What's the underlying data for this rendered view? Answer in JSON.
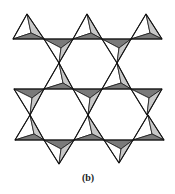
{
  "figure": {
    "caption": "(b)",
    "colors": {
      "background": "#ffffff",
      "face_light": "#ffffff",
      "face_mid": "#c8c8c8",
      "face_dark": "#7a7a7a",
      "stroke": "#111111"
    },
    "tetrahedra_up": [
      {
        "apex": [
          27,
          14
        ],
        "left": [
          13,
          39
        ],
        "right": [
          44,
          39
        ],
        "center": [
          31,
          33
        ]
      },
      {
        "apex": [
          87,
          14
        ],
        "left": [
          73,
          39
        ],
        "right": [
          102,
          39
        ],
        "center": [
          91,
          33
        ]
      },
      {
        "apex": [
          146,
          14
        ],
        "left": [
          131,
          39
        ],
        "right": [
          162,
          39
        ],
        "center": [
          150,
          33
        ]
      },
      {
        "apex": [
          59,
          63
        ],
        "left": [
          44,
          89
        ],
        "right": [
          73,
          89
        ],
        "center": [
          63,
          83
        ]
      },
      {
        "apex": [
          117,
          63
        ],
        "left": [
          102,
          89
        ],
        "right": [
          131,
          89
        ],
        "center": [
          121,
          83
        ]
      },
      {
        "apex": [
          30,
          115
        ],
        "left": [
          15,
          140
        ],
        "right": [
          44,
          140
        ],
        "center": [
          34,
          134
        ]
      },
      {
        "apex": [
          88,
          115
        ],
        "left": [
          74,
          140
        ],
        "right": [
          104,
          140
        ],
        "center": [
          92,
          134
        ]
      },
      {
        "apex": [
          148,
          115
        ],
        "left": [
          133,
          140
        ],
        "right": [
          164,
          140
        ],
        "center": [
          152,
          134
        ]
      }
    ],
    "tetrahedra_down": [
      {
        "left": [
          44,
          39
        ],
        "right": [
          73,
          39
        ],
        "bottom": [
          59,
          63
        ],
        "center": [
          61,
          48
        ]
      },
      {
        "left": [
          102,
          39
        ],
        "right": [
          131,
          39
        ],
        "bottom": [
          117,
          63
        ],
        "center": [
          119,
          48
        ]
      },
      {
        "left": [
          14,
          89
        ],
        "right": [
          44,
          89
        ],
        "bottom": [
          30,
          115
        ],
        "center": [
          32,
          98
        ]
      },
      {
        "left": [
          73,
          89
        ],
        "right": [
          102,
          89
        ],
        "bottom": [
          88,
          115
        ],
        "center": [
          90,
          98
        ]
      },
      {
        "left": [
          131,
          89
        ],
        "right": [
          162,
          89
        ],
        "bottom": [
          147,
          115
        ],
        "center": [
          149,
          98
        ]
      },
      {
        "left": [
          44,
          140
        ],
        "right": [
          74,
          140
        ],
        "bottom": [
          59,
          164
        ],
        "center": [
          61,
          149
        ]
      },
      {
        "left": [
          104,
          140
        ],
        "right": [
          133,
          140
        ],
        "bottom": [
          119,
          163
        ],
        "center": [
          121,
          149
        ]
      }
    ]
  }
}
